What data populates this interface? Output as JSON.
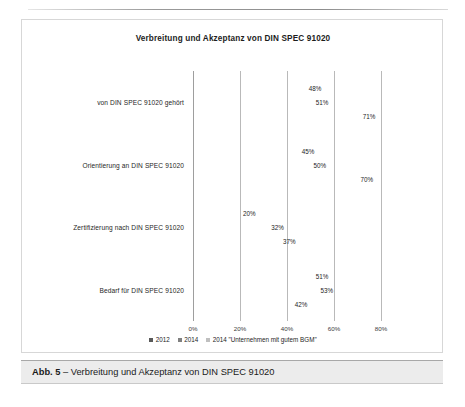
{
  "figure": {
    "caption_number": "Abb. 5",
    "caption_separator": " – ",
    "caption_text": "Verbreitung und Akzeptanz von DIN SPEC 91020"
  },
  "chart_data": {
    "type": "bar",
    "orientation": "horizontal",
    "title": "Verbreitung und Akzeptanz von DIN SPEC 91020",
    "xlabel": "",
    "ylabel": "",
    "xlim": [
      0,
      80
    ],
    "xtick_labels": [
      "0%",
      "20%",
      "40%",
      "60%",
      "80%"
    ],
    "xticks": [
      0,
      20,
      40,
      60,
      80
    ],
    "grid": true,
    "legend_position": "bottom",
    "value_suffix": "%",
    "categories": [
      "von DIN SPEC 91020 gehört",
      "Orientierung an DIN SPEC 91020",
      "Zertifizierung nach DIN SPEC 91020",
      "Bedarf für DIN SPEC 91020"
    ],
    "series": [
      {
        "name": "2012",
        "color": "#595959",
        "values": [
          48,
          45,
          20,
          51
        ],
        "labels": [
          "48%",
          "45%",
          "20%",
          "51%"
        ]
      },
      {
        "name": "2014",
        "color": "#808080",
        "values": [
          51,
          50,
          32,
          53
        ],
        "labels": [
          "51%",
          "50%",
          "32%",
          "53%"
        ]
      },
      {
        "name": "2014 \"Unternehmen mit gutem BGM\"",
        "color": "#bfbfbf",
        "values": [
          71,
          70,
          37,
          42
        ],
        "labels": [
          "71%",
          "70%",
          "37%",
          "42%"
        ]
      }
    ]
  }
}
